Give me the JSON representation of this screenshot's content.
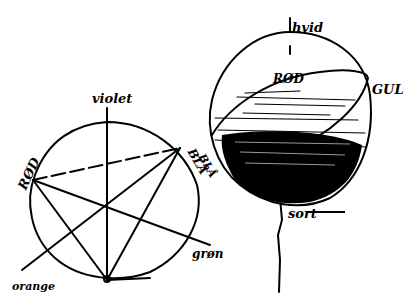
{
  "diagram": {
    "color_circle": {
      "labels": {
        "top": "violet",
        "left": "RØD",
        "upper_right": "BLÅ",
        "lower_right": "grøn",
        "lower_left": "orange"
      }
    },
    "color_sphere": {
      "labels": {
        "top": "hvid",
        "inner": "RØD",
        "right": "GUL",
        "left": "BLÅ",
        "bottom": "sort"
      }
    },
    "colors": {
      "ink": "#000000",
      "paper": "#ffffff"
    }
  }
}
